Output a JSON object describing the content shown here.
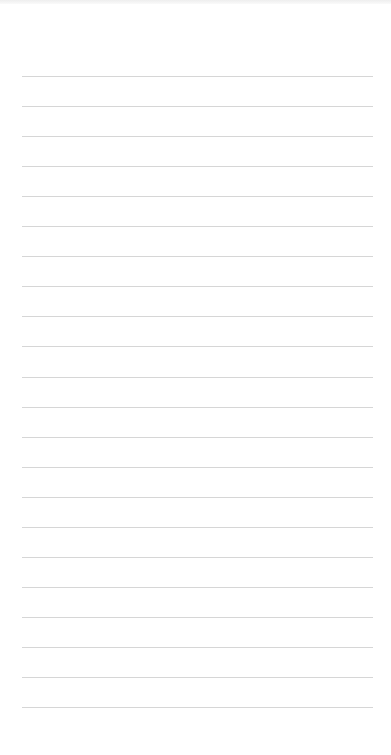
{
  "notepad": {
    "line_count": 22,
    "first_line_y": 76,
    "line_spacing": 30.05,
    "line_left": 22,
    "line_width": 351,
    "line_color": "#d6d6d6",
    "paper_color": "#ffffff"
  }
}
